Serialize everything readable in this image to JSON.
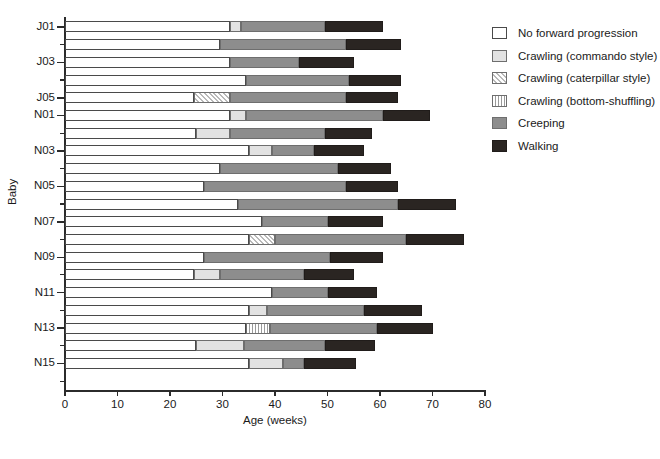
{
  "chart_data": {
    "type": "bar",
    "subtype": "stacked-horizontal-timeline",
    "title": "",
    "xlabel": "Age (weeks)",
    "ylabel": "Baby",
    "xlim": [
      0,
      80
    ],
    "xticks": [
      0,
      10,
      20,
      30,
      40,
      50,
      60,
      70,
      80
    ],
    "grid": false,
    "legend_position": "right",
    "series": [
      {
        "name": "No forward progression",
        "key": "none",
        "color": "#ffffff",
        "pattern": "solid"
      },
      {
        "name": "Crawling (commando style)",
        "key": "commando",
        "color": "#e2e2e2",
        "pattern": "solid"
      },
      {
        "name": "Crawling (caterpillar style)",
        "key": "caterpillar",
        "color": "#b9b9b9",
        "pattern": "diagonal-hatch"
      },
      {
        "name": "Crawling (bottom-shuffling)",
        "key": "shuffle",
        "color": "#9a9a9a",
        "pattern": "vertical-stripes"
      },
      {
        "name": "Creeping",
        "key": "creeping",
        "color": "#8d8d8d",
        "pattern": "solid"
      },
      {
        "name": "Walking",
        "key": "walking",
        "color": "#2a2522",
        "pattern": "solid"
      }
    ],
    "categories": [
      "J01",
      "J02",
      "J03",
      "J04",
      "J05",
      "N01",
      "N02",
      "N03",
      "N04",
      "N05",
      "N06",
      "N07",
      "N08",
      "N09",
      "N10",
      "N11",
      "N12",
      "N13",
      "N14",
      "N15",
      "N16"
    ],
    "labeled_categories": [
      "J01",
      "J03",
      "J05",
      "N01",
      "N03",
      "N05",
      "N07",
      "N09",
      "N11",
      "N13",
      "N15"
    ],
    "bars": [
      {
        "baby": "J01",
        "segments": [
          {
            "key": "none",
            "start": 0,
            "end": 31.5
          },
          {
            "key": "commando",
            "start": 31.5,
            "end": 33.5
          },
          {
            "key": "creeping",
            "start": 33.5,
            "end": 49.5
          },
          {
            "key": "walking",
            "start": 49.5,
            "end": 60.5
          }
        ]
      },
      {
        "baby": "J02",
        "segments": [
          {
            "key": "none",
            "start": 0,
            "end": 29.5
          },
          {
            "key": "creeping",
            "start": 29.5,
            "end": 53.5
          },
          {
            "key": "walking",
            "start": 53.5,
            "end": 64
          }
        ]
      },
      {
        "baby": "J03",
        "segments": [
          {
            "key": "none",
            "start": 0,
            "end": 31.5
          },
          {
            "key": "creeping",
            "start": 31.5,
            "end": 44.5
          },
          {
            "key": "walking",
            "start": 44.5,
            "end": 55
          }
        ]
      },
      {
        "baby": "J04",
        "segments": [
          {
            "key": "none",
            "start": 0,
            "end": 34.5
          },
          {
            "key": "creeping",
            "start": 34.5,
            "end": 54
          },
          {
            "key": "walking",
            "start": 54,
            "end": 64
          }
        ]
      },
      {
        "baby": "J05",
        "segments": [
          {
            "key": "none",
            "start": 0,
            "end": 24.5
          },
          {
            "key": "caterpillar",
            "start": 24.5,
            "end": 31.5
          },
          {
            "key": "creeping",
            "start": 31.5,
            "end": 53.5
          },
          {
            "key": "walking",
            "start": 53.5,
            "end": 63.5
          }
        ]
      },
      {
        "baby": "N01",
        "segments": [
          {
            "key": "none",
            "start": 0,
            "end": 31.5
          },
          {
            "key": "commando",
            "start": 31.5,
            "end": 34.5
          },
          {
            "key": "creeping",
            "start": 34.5,
            "end": 60.5
          },
          {
            "key": "walking",
            "start": 60.5,
            "end": 69.5
          }
        ]
      },
      {
        "baby": "N02",
        "segments": [
          {
            "key": "none",
            "start": 0,
            "end": 25
          },
          {
            "key": "commando",
            "start": 25,
            "end": 31.5
          },
          {
            "key": "creeping",
            "start": 31.5,
            "end": 49.5
          },
          {
            "key": "walking",
            "start": 49.5,
            "end": 58.5
          }
        ]
      },
      {
        "baby": "N03",
        "segments": [
          {
            "key": "none",
            "start": 0,
            "end": 35
          },
          {
            "key": "commando",
            "start": 35,
            "end": 39.5
          },
          {
            "key": "creeping",
            "start": 39.5,
            "end": 47.5
          },
          {
            "key": "walking",
            "start": 47.5,
            "end": 57
          }
        ]
      },
      {
        "baby": "N04",
        "segments": [
          {
            "key": "none",
            "start": 0,
            "end": 29.5
          },
          {
            "key": "creeping",
            "start": 29.5,
            "end": 52
          },
          {
            "key": "walking",
            "start": 52,
            "end": 62
          }
        ]
      },
      {
        "baby": "N05",
        "segments": [
          {
            "key": "none",
            "start": 0,
            "end": 26.5
          },
          {
            "key": "creeping",
            "start": 26.5,
            "end": 53.5
          },
          {
            "key": "walking",
            "start": 53.5,
            "end": 63.5
          }
        ]
      },
      {
        "baby": "N06",
        "segments": [
          {
            "key": "none",
            "start": 0,
            "end": 33
          },
          {
            "key": "creeping",
            "start": 33,
            "end": 63.5
          },
          {
            "key": "walking",
            "start": 63.5,
            "end": 74.5
          }
        ]
      },
      {
        "baby": "N07",
        "segments": [
          {
            "key": "none",
            "start": 0,
            "end": 37.5
          },
          {
            "key": "creeping",
            "start": 37.5,
            "end": 50
          },
          {
            "key": "walking",
            "start": 50,
            "end": 60.5
          }
        ]
      },
      {
        "baby": "N08",
        "segments": [
          {
            "key": "none",
            "start": 0,
            "end": 35
          },
          {
            "key": "caterpillar",
            "start": 35,
            "end": 40
          },
          {
            "key": "creeping",
            "start": 40,
            "end": 65
          },
          {
            "key": "walking",
            "start": 65,
            "end": 76
          }
        ]
      },
      {
        "baby": "N09",
        "segments": [
          {
            "key": "none",
            "start": 0,
            "end": 26.5
          },
          {
            "key": "creeping",
            "start": 26.5,
            "end": 50.5
          },
          {
            "key": "walking",
            "start": 50.5,
            "end": 60.5
          }
        ]
      },
      {
        "baby": "N10",
        "segments": [
          {
            "key": "none",
            "start": 0,
            "end": 24.5
          },
          {
            "key": "commando",
            "start": 24.5,
            "end": 29.5
          },
          {
            "key": "creeping",
            "start": 29.5,
            "end": 45.5
          },
          {
            "key": "walking",
            "start": 45.5,
            "end": 55
          }
        ]
      },
      {
        "baby": "N11",
        "segments": [
          {
            "key": "none",
            "start": 0,
            "end": 39.5
          },
          {
            "key": "creeping",
            "start": 39.5,
            "end": 50
          },
          {
            "key": "walking",
            "start": 50,
            "end": 59.5
          }
        ]
      },
      {
        "baby": "N12",
        "segments": [
          {
            "key": "none",
            "start": 0,
            "end": 35
          },
          {
            "key": "commando",
            "start": 35,
            "end": 38.5
          },
          {
            "key": "creeping",
            "start": 38.5,
            "end": 57
          },
          {
            "key": "walking",
            "start": 57,
            "end": 68
          }
        ]
      },
      {
        "baby": "N13",
        "segments": [
          {
            "key": "none",
            "start": 0,
            "end": 34.5
          },
          {
            "key": "shuffle",
            "start": 34.5,
            "end": 39
          },
          {
            "key": "creeping",
            "start": 39,
            "end": 59.5
          },
          {
            "key": "walking",
            "start": 59.5,
            "end": 70
          }
        ]
      },
      {
        "baby": "N14",
        "segments": [
          {
            "key": "none",
            "start": 0,
            "end": 25
          },
          {
            "key": "commando",
            "start": 25,
            "end": 34
          },
          {
            "key": "creeping",
            "start": 34,
            "end": 49.5
          },
          {
            "key": "walking",
            "start": 49.5,
            "end": 59
          }
        ]
      },
      {
        "baby": "N15",
        "segments": [
          {
            "key": "none",
            "start": 0,
            "end": 35
          },
          {
            "key": "commando",
            "start": 35,
            "end": 41.5
          },
          {
            "key": "creeping",
            "start": 41.5,
            "end": 45.5
          },
          {
            "key": "walking",
            "start": 45.5,
            "end": 55.5
          }
        ]
      },
      {
        "baby": "N16",
        "segments": [
          {
            "key": "none",
            "start": 0,
            "end": 0
          }
        ]
      }
    ]
  }
}
